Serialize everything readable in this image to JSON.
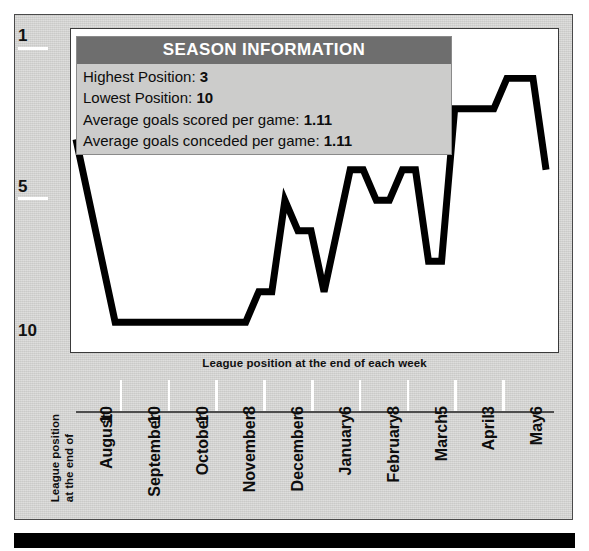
{
  "info_panel": {
    "title": "SEASON INFORMATION",
    "rows": [
      {
        "label": "Highest Position:",
        "value": "3"
      },
      {
        "label": "Lowest Position:",
        "value": "10"
      },
      {
        "label": "Average goals scored per game:",
        "value": "1.11"
      },
      {
        "label": "Average goals conceded per game:",
        "value": "1.11"
      }
    ]
  },
  "plot_caption": "League position at the end of each week",
  "axis_title_lines": [
    "League position",
    "at the end of"
  ],
  "colors": {
    "panel_background": "#d4d4d2",
    "plot_background": "#ffffff",
    "line": "#000000",
    "info_title_bar": "#6e6e6e",
    "info_body": "#cccccb",
    "bottom_bar": "#000000",
    "tick_mark": "#ffffff"
  },
  "chart_data": {
    "type": "line",
    "title": "SEASON INFORMATION",
    "xlabel": "League position at the end of each week",
    "ylabel": "League position at the end of",
    "ylim": [
      1,
      10
    ],
    "y_inverted": true,
    "grid": false,
    "legend": null,
    "y_ticks": [
      {
        "label": "1",
        "value": 1
      },
      {
        "label": "5",
        "value": 5
      },
      {
        "label": "10",
        "value": 10
      }
    ],
    "x_ticks": [
      {
        "month": "August",
        "day": "10"
      },
      {
        "month": "September",
        "day": "10"
      },
      {
        "month": "October",
        "day": "10"
      },
      {
        "month": "November",
        "day": "8"
      },
      {
        "month": "December",
        "day": "6"
      },
      {
        "month": "January",
        "day": "6"
      },
      {
        "month": "February",
        "day": "8"
      },
      {
        "month": "March",
        "day": "5"
      },
      {
        "month": "April",
        "day": "3"
      },
      {
        "month": "May",
        "day": "6"
      }
    ],
    "series": [
      {
        "name": "League position",
        "values": [
          4,
          6,
          8,
          10,
          10,
          10,
          10,
          10,
          10,
          10,
          10,
          10,
          10,
          10,
          9,
          9,
          6,
          7,
          7,
          9,
          7,
          5,
          5,
          6,
          6,
          5,
          5,
          8,
          8,
          3,
          3,
          3,
          3,
          2,
          2,
          2,
          5
        ]
      }
    ],
    "summary": {
      "highest_position": 3,
      "lowest_position": 10,
      "average_goals_scored_per_game": 1.11,
      "average_goals_conceded_per_game": 1.11
    }
  }
}
